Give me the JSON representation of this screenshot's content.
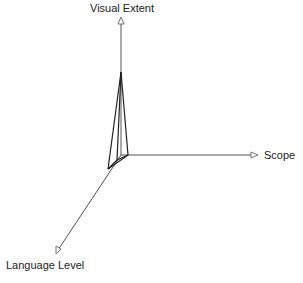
{
  "diagram": {
    "type": "3d-axes-kiviat",
    "axes": [
      {
        "id": "visual-extent",
        "label": "Visual Extent"
      },
      {
        "id": "scope",
        "label": "Scope"
      },
      {
        "id": "language-level",
        "label": "Language Level"
      }
    ],
    "colors": {
      "axis": "#555555",
      "shape": "#222222",
      "text": "#222222"
    }
  }
}
